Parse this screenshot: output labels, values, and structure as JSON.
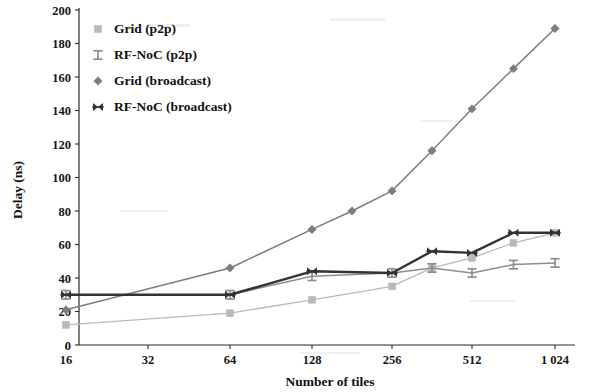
{
  "chart_data": {
    "type": "line",
    "title": "",
    "xlabel": "Number of tiles",
    "ylabel": "Delay (ns)",
    "x_scale": "log2-categorical",
    "x": [
      16,
      32,
      64,
      128,
      256,
      512,
      1024
    ],
    "x_tick_labels": [
      "16",
      "32",
      "64",
      "128",
      "256",
      "512",
      "1 024"
    ],
    "y_tick_labels": [
      "0",
      "20",
      "40",
      "60",
      "80",
      "100",
      "120",
      "140",
      "160",
      "180",
      "200"
    ],
    "y_ticks": [
      0,
      20,
      40,
      60,
      80,
      100,
      120,
      140,
      160,
      180,
      200
    ],
    "ylim": [
      0,
      200
    ],
    "grid": false,
    "legend_position": "top-left",
    "series": [
      {
        "name": "Grid (p2p)",
        "color": "#b9b9b9",
        "marker": "square",
        "x": [
          16,
          64,
          128,
          256,
          362,
          512,
          724,
          1024
        ],
        "values": [
          12,
          19,
          27,
          35,
          46,
          52,
          61,
          67
        ]
      },
      {
        "name": "RF-NoC (p2p)",
        "color": "#8e8e8e",
        "marker": "dash-bar",
        "x": [
          16,
          64,
          128,
          256,
          362,
          512,
          724,
          1024
        ],
        "values": [
          30,
          30,
          41,
          43,
          46,
          43,
          48,
          49
        ]
      },
      {
        "name": "Grid (broadcast)",
        "color": "#7d7d7d",
        "marker": "diamond",
        "x": [
          16,
          64,
          128,
          181,
          256,
          362,
          512,
          724,
          1024
        ],
        "values": [
          21,
          46,
          69,
          80,
          92,
          116,
          141,
          165,
          189
        ]
      },
      {
        "name": "RF-NoC (broadcast)",
        "color": "#333333",
        "marker": "bowtie",
        "x": [
          16,
          64,
          128,
          256,
          362,
          512,
          724,
          1024
        ],
        "values": [
          30,
          30,
          44,
          43,
          56,
          55,
          67,
          67
        ]
      }
    ]
  },
  "legend": {
    "items": [
      {
        "label": "Grid (p2p)"
      },
      {
        "label": "RF-NoC (p2p)"
      },
      {
        "label": "Grid (broadcast)"
      },
      {
        "label": "RF-NoC (broadcast)"
      }
    ]
  },
  "axes": {
    "y_title": "Delay (ns)",
    "x_title": "Number of tiles",
    "y_labels": [
      "200",
      "180",
      "160",
      "140",
      "120",
      "100",
      "80",
      "60",
      "40",
      "20",
      "0"
    ],
    "x_labels": [
      "16",
      "32",
      "64",
      "128",
      "256",
      "512",
      "1 024"
    ]
  }
}
